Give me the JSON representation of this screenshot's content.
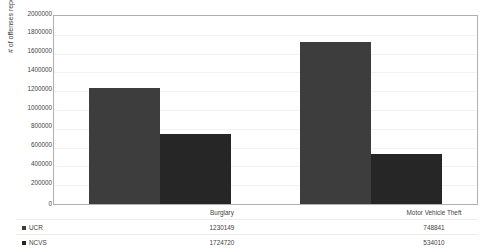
{
  "chart_data": {
    "type": "bar",
    "title": "",
    "xlabel": "",
    "ylabel": "# of offenses reported",
    "categories": [
      "Burglary",
      "Motor Vehicle Theft"
    ],
    "series": [
      {
        "name": "UCR",
        "values": [
          1230149,
          1724720
        ],
        "color": "#3d3d3d"
      },
      {
        "name": "NCVS",
        "values": [
          748841,
          534010
        ],
        "color": "#262626"
      }
    ],
    "series_by_category": {
      "Burglary": {
        "UCR": 1230149,
        "NCVS": 1724720
      },
      "Motor Vehicle Theft": {
        "UCR": 748841,
        "NCVS": 534010
      }
    },
    "ylim": [
      0,
      2000000
    ],
    "ytick_step": 200000,
    "ytick_labels": [
      "2000000",
      "1800000",
      "1600000",
      "1400000",
      "1200000",
      "1000000",
      "800000",
      "600000",
      "400000",
      "200000",
      "0"
    ],
    "grid": true,
    "legend_position": "data-table-below",
    "show_data_table": true
  },
  "axis": {
    "y_title": "# of offenses reported",
    "ticks": [
      {
        "label": "2000000",
        "value": 2000000
      },
      {
        "label": "1800000",
        "value": 1800000
      },
      {
        "label": "1600000",
        "value": 1600000
      },
      {
        "label": "1400000",
        "value": 1400000
      },
      {
        "label": "1200000",
        "value": 1200000
      },
      {
        "label": "1000000",
        "value": 1000000
      },
      {
        "label": "800000",
        "value": 800000
      },
      {
        "label": "600000",
        "value": 600000
      },
      {
        "label": "400000",
        "value": 400000
      },
      {
        "label": "200000",
        "value": 200000
      },
      {
        "label": "0",
        "value": 0
      }
    ]
  },
  "table": {
    "header": {
      "blank": "",
      "col0": "Burglary",
      "col1": "Motor Vehicle Theft"
    },
    "rows": [
      {
        "legend": "UCR",
        "col0": "1230149",
        "col1": "748841",
        "swatch": "ucr"
      },
      {
        "legend": "NCVS",
        "col0": "1724720",
        "col1": "534010",
        "swatch": "ncvs"
      }
    ]
  }
}
